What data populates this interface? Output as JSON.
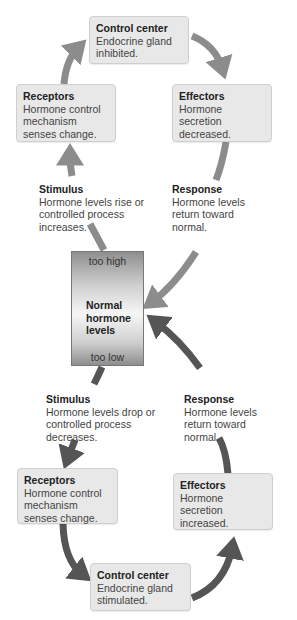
{
  "top_loop": {
    "control_center": {
      "title": "Control center",
      "text": "Endocrine gland inhibited."
    },
    "receptors": {
      "title": "Receptors",
      "text": "Hormone control mechanism senses change."
    },
    "effectors": {
      "title": "Effectors",
      "text": "Hormone secretion decreased."
    },
    "stimulus": {
      "title": "Stimulus",
      "text": "Hormone levels rise or controlled process increases."
    },
    "response": {
      "title": "Response",
      "text": "Hormone levels return toward normal."
    }
  },
  "meter": {
    "too_high": "too high",
    "label": "Normal hormone levels",
    "too_low": "too low"
  },
  "bottom_loop": {
    "stimulus": {
      "title": "Stimulus",
      "text": "Hormone levels drop or controlled process decreases."
    },
    "response": {
      "title": "Response",
      "text": "Hormone levels return toward normal."
    },
    "receptors": {
      "title": "Receptors",
      "text": "Hormone control mechanism senses change."
    },
    "effectors": {
      "title": "Effectors",
      "text": "Hormone secretion increased."
    },
    "control_center": {
      "title": "Control center",
      "text": "Endocrine gland stimulated."
    }
  },
  "colors": {
    "top_arrow": "#8c8c8c",
    "bottom_arrow": "#555555",
    "box_bg": "#e8e8e8",
    "box_border": "#cfcfcf"
  }
}
